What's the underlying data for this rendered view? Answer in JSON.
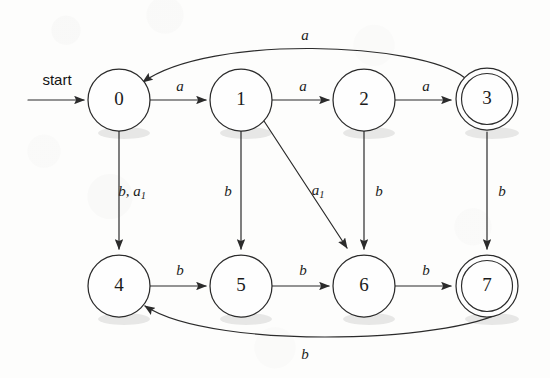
{
  "figure": {
    "kind": "finite-state-automaton",
    "background_color": "#fdfdfc",
    "ink_color": "#2b2b2b",
    "start_label": "start"
  },
  "states": [
    {
      "id": "s0",
      "label": "0",
      "cx": 119,
      "cy": 100,
      "r": 31,
      "accepting": false
    },
    {
      "id": "s1",
      "label": "1",
      "cx": 241,
      "cy": 100,
      "r": 31,
      "accepting": false
    },
    {
      "id": "s2",
      "label": "2",
      "cx": 364,
      "cy": 100,
      "r": 31,
      "accepting": false
    },
    {
      "id": "s3",
      "label": "3",
      "cx": 487,
      "cy": 99,
      "r": 31,
      "accepting": true
    },
    {
      "id": "s4",
      "label": "4",
      "cx": 119,
      "cy": 286,
      "r": 31,
      "accepting": false
    },
    {
      "id": "s5",
      "label": "5",
      "cx": 241,
      "cy": 286,
      "r": 31,
      "accepting": false
    },
    {
      "id": "s6",
      "label": "6",
      "cx": 364,
      "cy": 286,
      "r": 31,
      "accepting": false
    },
    {
      "id": "s7",
      "label": "7",
      "cx": 487,
      "cy": 286,
      "r": 31,
      "accepting": true
    }
  ],
  "transitions": [
    {
      "id": "t01",
      "from": "0",
      "to": "1",
      "symbol": "a",
      "sub": "",
      "label_x": 180,
      "label_y": 88
    },
    {
      "id": "t12",
      "from": "1",
      "to": "2",
      "symbol": "a",
      "sub": "",
      "label_x": 303,
      "label_y": 88
    },
    {
      "id": "t23",
      "from": "2",
      "to": "3",
      "symbol": "a",
      "sub": "",
      "label_x": 426,
      "label_y": 88
    },
    {
      "id": "t30",
      "from": "3",
      "to": "0",
      "symbol": "a",
      "sub": "",
      "label_x": 305,
      "label_y": 37
    },
    {
      "id": "t04",
      "from": "0",
      "to": "4",
      "symbol": "b, a",
      "sub": "1",
      "label_x": 132,
      "label_y": 193
    },
    {
      "id": "t15",
      "from": "1",
      "to": "5",
      "symbol": "b",
      "sub": "",
      "label_x": 228,
      "label_y": 193
    },
    {
      "id": "t16",
      "from": "1",
      "to": "6",
      "symbol": "a",
      "sub": "1",
      "label_x": 318,
      "label_y": 192
    },
    {
      "id": "t26",
      "from": "2",
      "to": "6",
      "symbol": "b",
      "sub": "",
      "label_x": 379,
      "label_y": 193
    },
    {
      "id": "t37",
      "from": "3",
      "to": "7",
      "symbol": "b",
      "sub": "",
      "label_x": 502,
      "label_y": 193
    },
    {
      "id": "t45",
      "from": "4",
      "to": "5",
      "symbol": "b",
      "sub": "",
      "label_x": 180,
      "label_y": 272
    },
    {
      "id": "t56",
      "from": "5",
      "to": "6",
      "symbol": "b",
      "sub": "",
      "label_x": 303,
      "label_y": 272
    },
    {
      "id": "t67",
      "from": "6",
      "to": "7",
      "symbol": "b",
      "sub": "",
      "label_x": 426,
      "label_y": 272
    },
    {
      "id": "t74",
      "from": "7",
      "to": "4",
      "symbol": "b",
      "sub": "",
      "label_x": 305,
      "label_y": 356
    }
  ]
}
